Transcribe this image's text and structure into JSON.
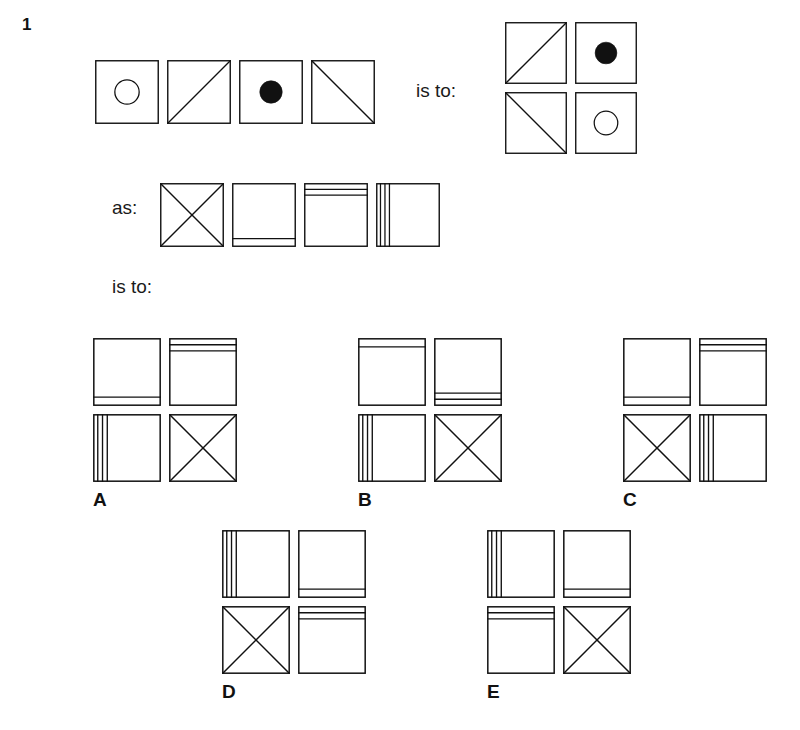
{
  "page": {
    "background": "#ffffff",
    "ink": "#111111",
    "width": 730,
    "height": 800
  },
  "question": {
    "number": "1",
    "relation_1": "is to:",
    "relation_2": "as:",
    "relation_3": "is to:"
  },
  "glyph_legend": {
    "open-circle": "open circle outline centred in square",
    "filled-circle": "solid black circle centred in square",
    "diagonal-up": "single diagonal line from bottom-left to top-right",
    "diagonal-down": "single diagonal line from top-left to bottom-right",
    "cross": "both diagonals forming an X",
    "one-line-bottom": "one horizontal line near the bottom edge",
    "one-line-top": "one horizontal line near the top edge",
    "two-lines-top": "two horizontal lines near the top edge",
    "two-lines-bottom": "two horizontal lines near the bottom edge",
    "three-lines-left": "three vertical lines near the left edge",
    "blank": "empty square"
  },
  "stimulus": {
    "top_row": {
      "name": "analogy-term-a",
      "cells": [
        "open-circle",
        "diagonal-up",
        "filled-circle",
        "diagonal-down"
      ]
    },
    "top_answer": {
      "name": "analogy-term-b",
      "cells": [
        [
          "diagonal-up",
          "filled-circle"
        ],
        [
          "diagonal-down",
          "open-circle"
        ]
      ]
    },
    "second_row": {
      "name": "analogy-term-c",
      "cells": [
        "cross",
        "one-line-bottom",
        "two-lines-top",
        "three-lines-left"
      ]
    }
  },
  "options": [
    {
      "letter": "A",
      "cells": [
        [
          "one-line-bottom",
          "two-lines-top"
        ],
        [
          "three-lines-left",
          "cross"
        ]
      ]
    },
    {
      "letter": "B",
      "cells": [
        [
          "one-line-top",
          "two-lines-bottom"
        ],
        [
          "three-lines-left",
          "cross"
        ]
      ]
    },
    {
      "letter": "C",
      "cells": [
        [
          "one-line-bottom",
          "two-lines-top"
        ],
        [
          "cross",
          "three-lines-left"
        ]
      ]
    },
    {
      "letter": "D",
      "cells": [
        [
          "three-lines-left",
          "one-line-bottom"
        ],
        [
          "cross",
          "two-lines-top"
        ]
      ]
    },
    {
      "letter": "E",
      "cells": [
        [
          "three-lines-left",
          "one-line-bottom"
        ],
        [
          "two-lines-top",
          "cross"
        ]
      ]
    }
  ],
  "layout": {
    "q_number_pos": [
      22,
      16
    ],
    "top_row_pos": [
      95,
      60
    ],
    "top_row_cell": 64,
    "top_row_gap": 8,
    "rel1_pos": [
      416,
      80
    ],
    "top_answer_pos": [
      505,
      22
    ],
    "answer_cell": 62,
    "answer_gap": 8,
    "rel2_pos": [
      112,
      196
    ],
    "second_row_pos": [
      160,
      183
    ],
    "second_row_cell": 64,
    "second_row_gap": 8,
    "rel3_pos": [
      112,
      275
    ],
    "options_row1_y": 338,
    "options_row1_x": [
      93,
      358,
      623
    ],
    "options_row2_y": 530,
    "options_row2_x": [
      222,
      487
    ],
    "option_cell": 68,
    "option_gap": 8,
    "letter_offset_y": 152
  }
}
